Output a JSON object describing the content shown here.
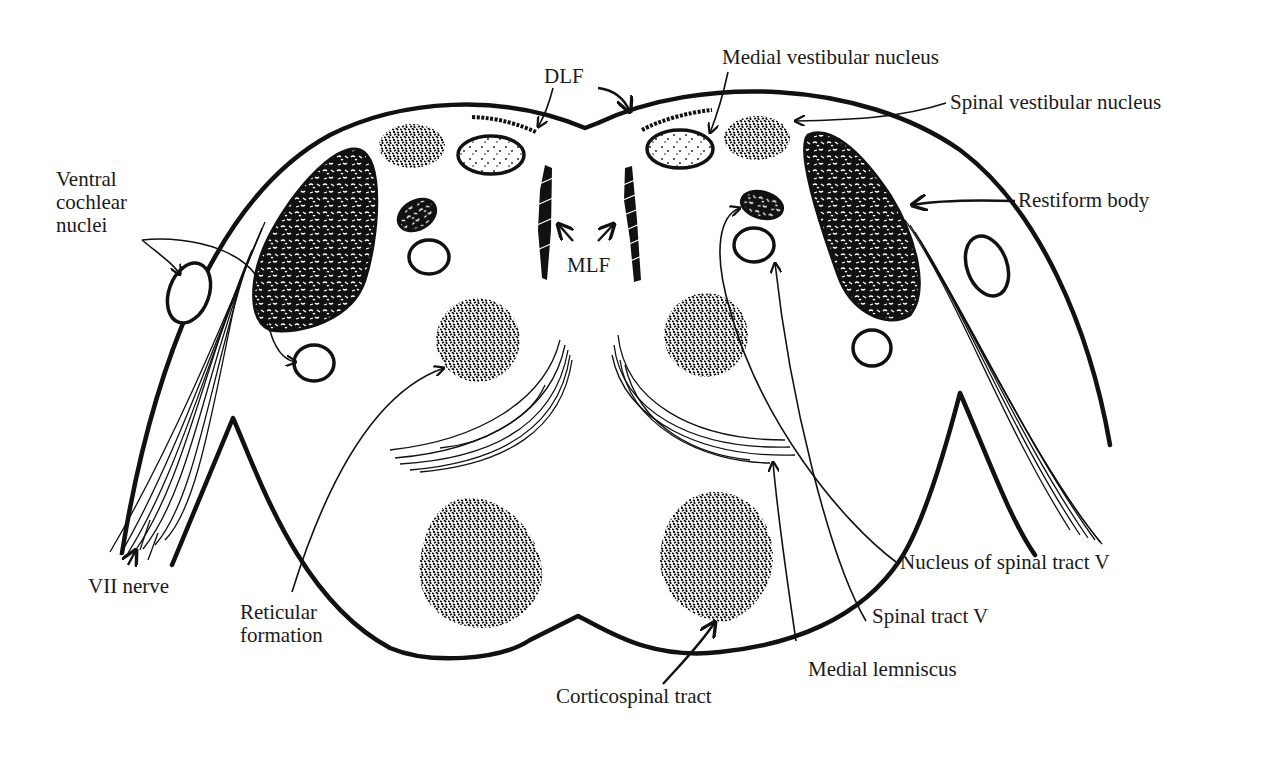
{
  "figure": {
    "background": "#ffffff",
    "ink_color": "#111111"
  },
  "labels": {
    "ventral_cochlear_nuclei": [
      "Ventral",
      "cochlear",
      "nuclei"
    ],
    "dlf": "DLF",
    "medial_vestibular_nucleus": "Medial vestibular nucleus",
    "spinal_vestibular_nucleus": "Spinal vestibular nucleus",
    "restiform_body": "Restiform body",
    "mlf": "MLF",
    "vii_nerve": "VII nerve",
    "reticular_formation": [
      "Reticular",
      "formation"
    ],
    "nucleus_of_spinal_tract_v": "Nucleus of spinal tract V",
    "spinal_tract_v": "Spinal tract V",
    "medial_lemniscus": "Medial lemniscus",
    "corticospinal_tract": "Corticospinal tract"
  },
  "structures": [
    {
      "name": "Ventral cochlear nuclei",
      "side": "bilateral",
      "style": "open ellipse"
    },
    {
      "name": "DLF",
      "side": "bilateral",
      "style": "stippled streak"
    },
    {
      "name": "Medial vestibular nucleus",
      "side": "bilateral",
      "style": "light-stippled ellipse"
    },
    {
      "name": "Spinal vestibular nucleus",
      "side": "bilateral",
      "style": "dense-stippled patch"
    },
    {
      "name": "Restiform body",
      "side": "bilateral",
      "style": "dark speckled teardrop"
    },
    {
      "name": "MLF",
      "side": "bilateral",
      "style": "hatched vertical bar"
    },
    {
      "name": "VII nerve",
      "side": "bilateral",
      "style": "fiber bundle"
    },
    {
      "name": "Reticular formation",
      "side": "bilateral",
      "style": "stippled circle"
    },
    {
      "name": "Nucleus of spinal tract V",
      "side": "bilateral",
      "style": "dark small ellipse"
    },
    {
      "name": "Spinal tract V",
      "side": "bilateral",
      "style": "open circle"
    },
    {
      "name": "Medial lemniscus",
      "side": "bilateral",
      "style": "curved fiber band"
    },
    {
      "name": "Corticospinal tract",
      "side": "bilateral",
      "style": "dense-stippled mass"
    }
  ]
}
